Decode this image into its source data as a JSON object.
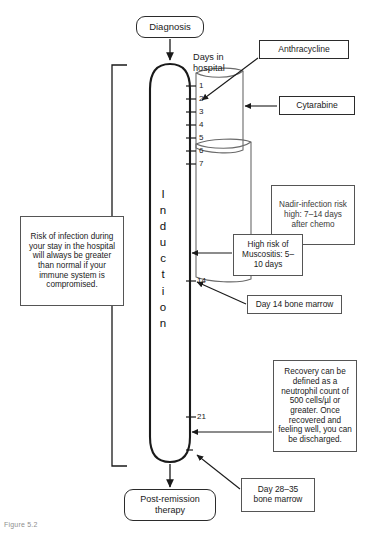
{
  "figure": {
    "caption": "Figure 5.2",
    "axis_label": "Days in\nhospital"
  },
  "phase": {
    "name": "Induction",
    "letters": [
      "I",
      "n",
      "d",
      "u",
      "c",
      "t",
      "i",
      "o",
      "n"
    ]
  },
  "terminators": {
    "start": "Diagnosis",
    "end": "Post-remission\ntherapy"
  },
  "day_ticks": [
    {
      "day": "1"
    },
    {
      "day": "2"
    },
    {
      "day": "3"
    },
    {
      "day": "4"
    },
    {
      "day": "5"
    },
    {
      "day": "6"
    },
    {
      "day": "7"
    },
    {
      "day": "14"
    },
    {
      "day": "21"
    }
  ],
  "drugs": [
    {
      "name": "Anthracycline",
      "target_day": "2"
    },
    {
      "name": "Cytarabine",
      "target_day": "1-7"
    }
  ],
  "annotations": {
    "infection_risk": "Risk of infection during your stay in the hospital will always be greater than normal if your immune system is compromised.",
    "nadir": "Nadir-infection risk high: 7–14 days after chemo",
    "mucositis": "High risk of Muscositis: 5–10 days",
    "day14_marrow": "Day 14 bone marrow",
    "recovery": "Recovery can be defined as a neutrophil count of 500 cells/µl or greater. Once recovered and feeling well, you can be discharged.",
    "day28_marrow": "Day 28–35\nbone marrow"
  },
  "colors": {
    "ink": "#1a1a1a",
    "line": "#2b2b2b",
    "note_border": "#555555",
    "background": "#ffffff"
  }
}
